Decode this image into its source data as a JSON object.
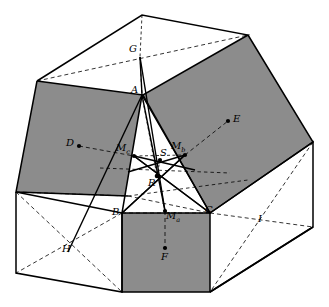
{
  "figure": {
    "type": "geometric-diagram",
    "colors": {
      "stroke": "#000000",
      "shaded_face": "#8c8c8c",
      "white_face": "#ffffff",
      "background": "#ffffff"
    },
    "labels": [
      {
        "id": "G",
        "text": "G",
        "sub": "",
        "x": 129,
        "y": 47
      },
      {
        "id": "A",
        "text": "A",
        "sub": "",
        "x": 131,
        "y": 88
      },
      {
        "id": "E",
        "text": "E",
        "sub": "",
        "x": 233,
        "y": 117
      },
      {
        "id": "D",
        "text": "D",
        "sub": "",
        "x": 67,
        "y": 141
      },
      {
        "id": "Mc",
        "text": "M",
        "sub": "c",
        "x": 116,
        "y": 146
      },
      {
        "id": "Mb",
        "text": "M",
        "sub": "b",
        "x": 172,
        "y": 144
      },
      {
        "id": "S",
        "text": "S",
        "sub": "",
        "x": 160,
        "y": 151
      },
      {
        "id": "R",
        "text": "R",
        "sub": "",
        "x": 148,
        "y": 181
      },
      {
        "id": "B",
        "text": "B",
        "sub": "",
        "x": 113,
        "y": 210
      },
      {
        "id": "Ma",
        "text": "M",
        "sub": "a",
        "x": 166,
        "y": 214
      },
      {
        "id": "C",
        "text": "C",
        "sub": "",
        "x": 206,
        "y": 208
      },
      {
        "id": "I",
        "text": "I",
        "sub": "",
        "x": 258,
        "y": 217
      },
      {
        "id": "H",
        "text": "H",
        "sub": "",
        "x": 63,
        "y": 247
      },
      {
        "id": "F",
        "text": "F",
        "sub": "",
        "x": 162,
        "y": 254
      }
    ],
    "points": [
      {
        "id": "D",
        "x": 79,
        "y": 146
      },
      {
        "id": "Mc",
        "x": 134,
        "y": 156
      },
      {
        "id": "Mb",
        "x": 185,
        "y": 155
      },
      {
        "id": "E",
        "x": 228,
        "y": 121
      },
      {
        "id": "S",
        "x": 160,
        "y": 160
      },
      {
        "id": "R",
        "x": 157,
        "y": 176
      },
      {
        "id": "Ma",
        "x": 165,
        "y": 211
      },
      {
        "id": "F",
        "x": 165,
        "y": 248
      },
      {
        "id": "G",
        "x": 140,
        "y": 57
      }
    ]
  }
}
